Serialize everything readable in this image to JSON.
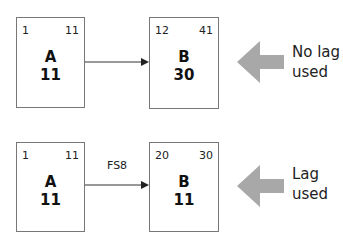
{
  "diagrams": [
    {
      "id": "no-lag",
      "activity_a": {
        "name": "A",
        "duration": "11",
        "early_start": "1",
        "early_finish": "11"
      },
      "activity_b": {
        "name": "B",
        "duration": "30",
        "early_start": "12",
        "early_finish": "41"
      },
      "relation_label": "",
      "caption_line1": "No lag",
      "caption_line2": "used"
    },
    {
      "id": "lag",
      "activity_a": {
        "name": "A",
        "duration": "11",
        "early_start": "1",
        "early_finish": "11"
      },
      "activity_b": {
        "name": "B",
        "duration": "11",
        "early_start": "20",
        "early_finish": "30"
      },
      "relation_label": "FS8",
      "caption_line1": "Lag",
      "caption_line2": "used"
    }
  ],
  "colors": {
    "box_border": "#777777",
    "pointer_arrow": "#a8a8a8",
    "connector": "#333333"
  }
}
